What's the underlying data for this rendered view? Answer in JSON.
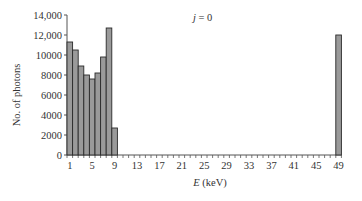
{
  "chart_data": {
    "type": "bar",
    "title": "",
    "annotation": {
      "italic": "j",
      "rest": " = 0"
    },
    "xlabel": {
      "italic": "E",
      "rest": " (keV)"
    },
    "ylabel": "No. of photons",
    "ylim": [
      0,
      14000
    ],
    "yticks": [
      {
        "value": 0,
        "label": "0"
      },
      {
        "value": 2000,
        "label": "2000"
      },
      {
        "value": 4000,
        "label": "4000"
      },
      {
        "value": 6000,
        "label": "6000"
      },
      {
        "value": 8000,
        "label": "8000"
      },
      {
        "value": 10000,
        "label": "10000"
      },
      {
        "value": 12000,
        "label": "12,000"
      },
      {
        "value": 14000,
        "label": "14,000"
      }
    ],
    "xtick_labels": [
      "1",
      "5",
      "9",
      "13",
      "17",
      "21",
      "25",
      "29",
      "33",
      "37",
      "41",
      "45",
      "49"
    ],
    "categories": [
      1,
      2,
      3,
      4,
      5,
      6,
      7,
      8,
      9,
      10,
      11,
      12,
      13,
      14,
      15,
      16,
      17,
      18,
      19,
      20,
      21,
      22,
      23,
      24,
      25,
      26,
      27,
      28,
      29,
      30,
      31,
      32,
      33,
      34,
      35,
      36,
      37,
      38,
      39,
      40,
      41,
      42,
      43,
      44,
      45,
      46,
      47,
      48,
      49
    ],
    "values": [
      11300,
      10500,
      8900,
      8000,
      7600,
      8200,
      9800,
      12700,
      2700,
      0,
      0,
      0,
      0,
      0,
      0,
      0,
      0,
      0,
      0,
      0,
      0,
      0,
      0,
      0,
      0,
      0,
      0,
      0,
      0,
      0,
      0,
      0,
      0,
      0,
      0,
      0,
      0,
      0,
      0,
      0,
      0,
      0,
      0,
      0,
      0,
      0,
      0,
      0,
      12000
    ],
    "grid": false,
    "legend": null,
    "colors": {
      "bar_fill": "#9a9a9a",
      "bar_stroke": "#2a2a2a",
      "axis": "#555555"
    }
  }
}
